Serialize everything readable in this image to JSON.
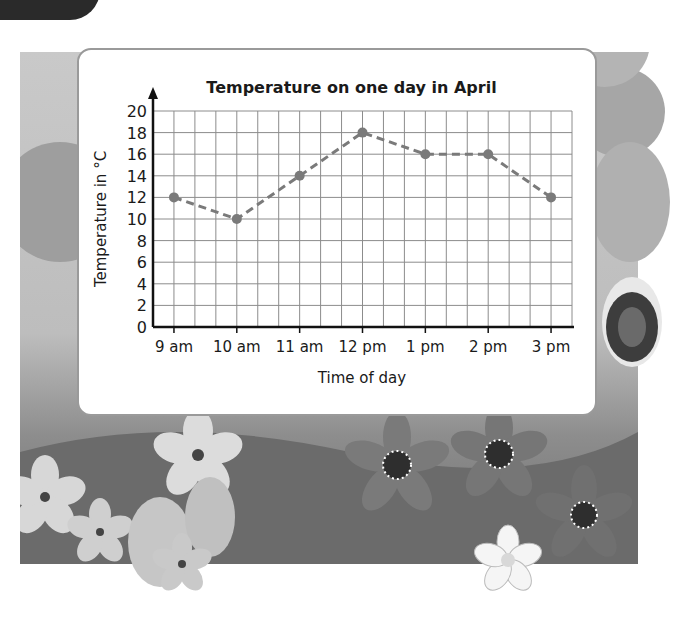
{
  "chart_data": {
    "type": "line",
    "title": "Temperature on one day in April",
    "xlabel": "Time of day",
    "ylabel": "Temperature in °C",
    "categories": [
      "9 am",
      "10 am",
      "11 am",
      "12 pm",
      "1 pm",
      "2 pm",
      "3 pm"
    ],
    "series": [
      {
        "name": "Temperature",
        "values": [
          12,
          10,
          14,
          18,
          16,
          16,
          12
        ]
      }
    ],
    "ylim": [
      0,
      20
    ],
    "yticks": [
      0,
      2,
      4,
      6,
      8,
      10,
      12,
      14,
      16,
      18,
      20
    ],
    "grid": true,
    "line_style": "dashed",
    "marker": "circle",
    "colors": {
      "line": "#7a7a7a",
      "grid": "#8c8c8c",
      "axis": "#111111"
    }
  }
}
